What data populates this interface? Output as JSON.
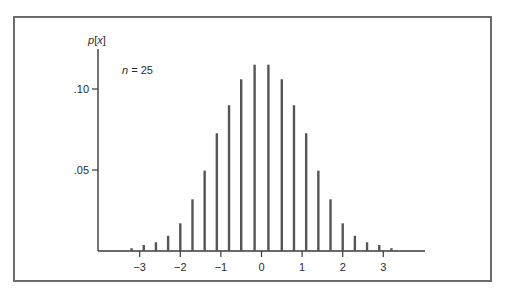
{
  "chart_data": {
    "type": "bar",
    "title": "",
    "annotation": "n = 25",
    "annotation_var": "n",
    "annotation_value": "25",
    "xlabel": "",
    "ylabel": "p[x]",
    "ylabel_func": "p",
    "ylabel_arg": "x",
    "xlim": [
      -3.3,
      3.9
    ],
    "ylim": [
      0,
      0.12
    ],
    "grid": false,
    "legend": null,
    "xticks": [
      -3,
      -2,
      -1,
      0,
      1,
      2,
      3
    ],
    "xtick_labels": [
      "−3",
      "−2",
      "−1",
      "0",
      "1",
      "2",
      "3"
    ],
    "yticks": [
      0.05,
      0.1
    ],
    "ytick_labels": [
      ".05",
      ".10"
    ],
    "x": [
      -3.2,
      -2.9,
      -2.6,
      -2.3,
      -2.0,
      -1.7,
      -1.4,
      -1.1,
      -0.8,
      -0.5,
      -0.17,
      0.17,
      0.5,
      0.8,
      1.1,
      1.4,
      1.7,
      2.0,
      2.3,
      2.6,
      2.9,
      3.2
    ],
    "values": [
      0.0017,
      0.0037,
      0.0054,
      0.0094,
      0.0171,
      0.0319,
      0.0496,
      0.0727,
      0.09,
      0.106,
      0.115,
      0.115,
      0.106,
      0.09,
      0.0727,
      0.0496,
      0.0319,
      0.0171,
      0.0094,
      0.0054,
      0.0037,
      0.0017
    ]
  },
  "colors": {
    "bar": "#555555",
    "axis": "#3a3a3a",
    "frame": "#6b6b6b",
    "text": "#2b2b2b"
  }
}
